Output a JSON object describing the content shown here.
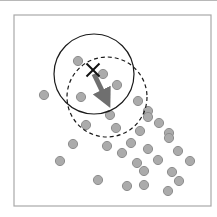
{
  "diagram": {
    "title": "",
    "type": "mean-shift-step",
    "colors": {
      "background": "#ffffff",
      "frame": "#a9a9a9",
      "point_fill": "#ababab",
      "point_stroke": "#8e8e8e",
      "window_stroke": "#1a1a1a",
      "arrow": "#6f6f6f",
      "marker": "#111111"
    },
    "frame": {
      "x": 14,
      "y": 15,
      "width": 197,
      "height": 191
    },
    "current_window": {
      "cx": 94,
      "cy": 74,
      "r": 40,
      "style": "solid"
    },
    "shifted_window": {
      "cx": 107,
      "cy": 97,
      "r": 40,
      "style": "dashed"
    },
    "centroid_marker": {
      "x": 93,
      "y": 70,
      "symbol": "X"
    },
    "shift_vector": {
      "x1": 94,
      "y1": 74,
      "x2": 106,
      "y2": 99
    },
    "point_radius": 4.6,
    "points": [
      {
        "x": 78,
        "y": 61
      },
      {
        "x": 103,
        "y": 74
      },
      {
        "x": 117,
        "y": 85
      },
      {
        "x": 44,
        "y": 95
      },
      {
        "x": 81,
        "y": 97
      },
      {
        "x": 138,
        "y": 101
      },
      {
        "x": 148,
        "y": 111
      },
      {
        "x": 148,
        "y": 117
      },
      {
        "x": 110,
        "y": 115
      },
      {
        "x": 86,
        "y": 125
      },
      {
        "x": 116,
        "y": 128
      },
      {
        "x": 159,
        "y": 123
      },
      {
        "x": 140,
        "y": 131
      },
      {
        "x": 169,
        "y": 133
      },
      {
        "x": 169,
        "y": 138
      },
      {
        "x": 73,
        "y": 144
      },
      {
        "x": 107,
        "y": 146
      },
      {
        "x": 131,
        "y": 143
      },
      {
        "x": 122,
        "y": 153
      },
      {
        "x": 148,
        "y": 149
      },
      {
        "x": 178,
        "y": 151
      },
      {
        "x": 60,
        "y": 161
      },
      {
        "x": 158,
        "y": 160
      },
      {
        "x": 190,
        "y": 161
      },
      {
        "x": 137,
        "y": 163
      },
      {
        "x": 144,
        "y": 171
      },
      {
        "x": 172,
        "y": 172
      },
      {
        "x": 98,
        "y": 180
      },
      {
        "x": 179,
        "y": 181
      },
      {
        "x": 127,
        "y": 186
      },
      {
        "x": 144,
        "y": 185
      },
      {
        "x": 168,
        "y": 191
      }
    ]
  }
}
